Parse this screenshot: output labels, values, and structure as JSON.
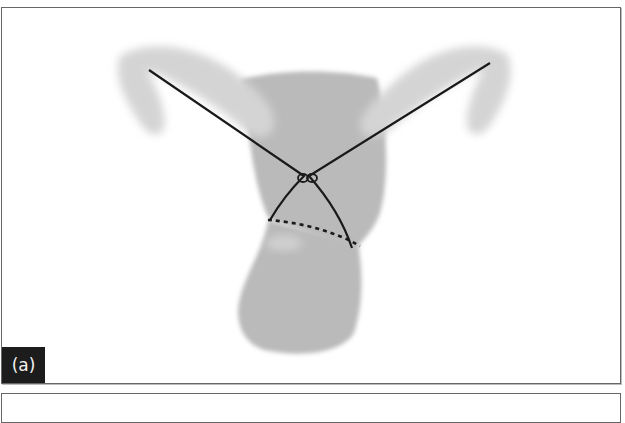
{
  "figure": {
    "panel_label": "(a)",
    "colors": {
      "tissue": "#b8b8b8",
      "tissue_light": "#d6d6d6",
      "suture": "#1a1a1a",
      "label_bg": "#1c1c1c",
      "label_text": "#f2f2f2",
      "border": "#666666"
    },
    "elements": [
      {
        "name": "left-tube",
        "type": "tissue"
      },
      {
        "name": "right-tube",
        "type": "tissue"
      },
      {
        "name": "uterine-body",
        "type": "tissue"
      },
      {
        "name": "cervix",
        "type": "tissue"
      },
      {
        "name": "suture-left-strand",
        "type": "line"
      },
      {
        "name": "suture-right-strand",
        "type": "line"
      },
      {
        "name": "suture-knot",
        "type": "knot"
      },
      {
        "name": "incision-line",
        "type": "dashed-line"
      }
    ]
  }
}
